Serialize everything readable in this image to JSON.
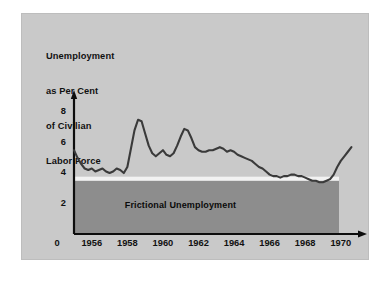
{
  "slide": {
    "background_color": "#c9c9c9",
    "band_color": "#8d8d8d",
    "line_color": "#3a3a3a",
    "separator_color": "#f2f2f2",
    "axis_color": "#0d0d0d"
  },
  "caption": {
    "line1": "Unemployment",
    "line2": "as Per Cent",
    "line3": "of Civilian",
    "line4": "Labor Force"
  },
  "band": {
    "label": "Frictional Unemployment",
    "level": 3.5
  },
  "chart_data": {
    "type": "line",
    "title": "Unemployment as Per Cent of Civilian Labor Force",
    "xlabel": "",
    "ylabel": "",
    "ylim": [
      0,
      8.6
    ],
    "xlim": [
      1955.0,
      1970.8
    ],
    "grid": false,
    "legend": null,
    "y_ticks": [
      "8",
      "6",
      "4",
      "2",
      "0"
    ],
    "y_tick_values": [
      8,
      6,
      4,
      2,
      0
    ],
    "x_ticks": [
      "1956",
      "1958",
      "1960",
      "1962",
      "1964",
      "1966",
      "1968",
      "1970"
    ],
    "x_tick_values": [
      1956,
      1958,
      1960,
      1962,
      1964,
      1966,
      1968,
      1970
    ],
    "origin_label": "0",
    "annotations": [
      {
        "text": "Frictional Unemployment",
        "y": 3.5,
        "type": "shaded-region"
      }
    ],
    "series": [
      {
        "name": "Unemployment rate",
        "x": [
          1955.0,
          1955.2,
          1955.4,
          1955.6,
          1955.8,
          1956.0,
          1956.2,
          1956.4,
          1956.6,
          1956.8,
          1957.0,
          1957.2,
          1957.4,
          1957.6,
          1957.8,
          1958.0,
          1958.2,
          1958.4,
          1958.6,
          1958.8,
          1959.0,
          1959.2,
          1959.4,
          1959.6,
          1959.8,
          1960.0,
          1960.2,
          1960.4,
          1960.6,
          1960.8,
          1961.0,
          1961.2,
          1961.4,
          1961.6,
          1961.8,
          1962.0,
          1962.2,
          1962.4,
          1962.6,
          1962.8,
          1963.0,
          1963.2,
          1963.4,
          1963.6,
          1963.8,
          1964.0,
          1964.2,
          1964.4,
          1964.6,
          1964.8,
          1965.0,
          1965.2,
          1965.4,
          1965.6,
          1965.8,
          1966.0,
          1966.2,
          1966.4,
          1966.6,
          1966.8,
          1967.0,
          1967.2,
          1967.4,
          1967.6,
          1967.8,
          1968.0,
          1968.2,
          1968.4,
          1968.6,
          1968.8,
          1969.0,
          1969.2,
          1969.4,
          1969.6,
          1969.8,
          1970.0,
          1970.2,
          1970.4,
          1970.6
        ],
        "values": [
          5.5,
          5.0,
          4.6,
          4.3,
          4.2,
          4.3,
          4.1,
          4.2,
          4.3,
          4.1,
          4.0,
          4.1,
          4.3,
          4.2,
          4.0,
          4.4,
          5.6,
          6.8,
          7.5,
          7.4,
          6.6,
          5.8,
          5.3,
          5.1,
          5.3,
          5.5,
          5.2,
          5.1,
          5.3,
          5.8,
          6.4,
          6.9,
          6.8,
          6.3,
          5.7,
          5.5,
          5.4,
          5.4,
          5.5,
          5.5,
          5.6,
          5.7,
          5.6,
          5.4,
          5.5,
          5.4,
          5.2,
          5.1,
          5.0,
          4.9,
          4.8,
          4.6,
          4.4,
          4.3,
          4.1,
          3.9,
          3.8,
          3.8,
          3.7,
          3.8,
          3.8,
          3.9,
          3.9,
          3.8,
          3.8,
          3.7,
          3.6,
          3.5,
          3.5,
          3.4,
          3.4,
          3.5,
          3.6,
          3.9,
          4.4,
          4.8,
          5.1,
          5.4,
          5.7
        ]
      }
    ]
  }
}
